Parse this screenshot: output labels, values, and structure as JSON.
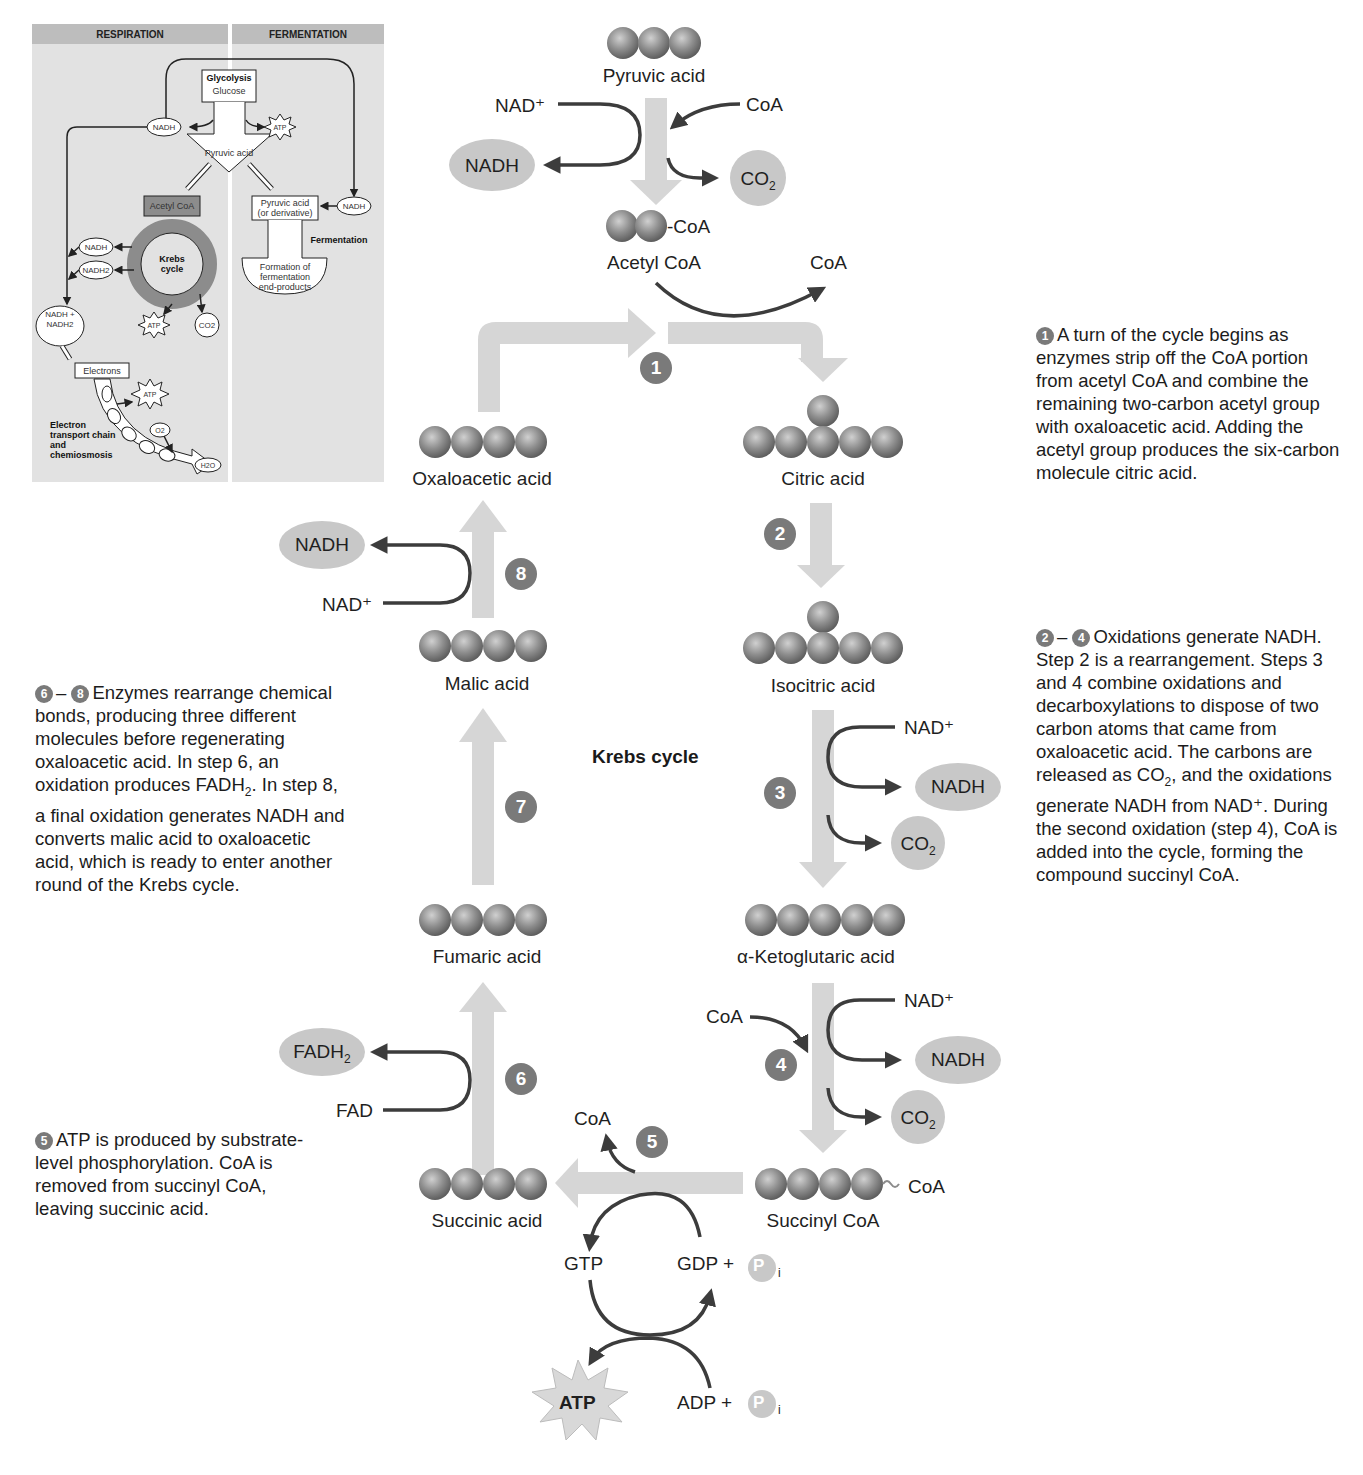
{
  "inset": {
    "header_left": "RESPIRATION",
    "header_right": "FERMENTATION",
    "glycolysis": "Glycolysis",
    "glucose": "Glucose",
    "pyruvic_acid": "Pyruvic acid",
    "nadh": "NADH",
    "atp": "ATP",
    "acetyl_coa": "Acetyl CoA",
    "krebs_cycle_1": "Krebs",
    "krebs_cycle_2": "cycle",
    "nadh2": "NADH2",
    "nadh_nadh2": "NADH + NADH2",
    "co2": "CO2",
    "electrons": "Electrons",
    "etc_label": "Electron transport chain and chemiosmosis",
    "o2": "O2",
    "h2o": "H2O",
    "pyruvic_derivative_1": "Pyruvic acid",
    "pyruvic_derivative_2": "(or derivative)",
    "fermentation": "Fermentation",
    "formation_1": "Formation of",
    "formation_2": "fermentation",
    "formation_3": "end-products"
  },
  "diagram": {
    "title": "Krebs cycle",
    "molecules": {
      "pyruvic_acid": "Pyruvic acid",
      "acetyl_coa": "Acetyl CoA",
      "acetyl_coa_tag": "-CoA",
      "oxaloacetic_acid": "Oxaloacetic acid",
      "citric_acid": "Citric acid",
      "isocitric_acid": "Isocitric acid",
      "alpha_ketoglutaric_acid": "α-Ketoglutaric acid",
      "succinyl_coa": "Succinyl CoA",
      "succinyl_coa_tag": "CoA",
      "succinic_acid": "Succinic acid",
      "fumaric_acid": "Fumaric acid",
      "malic_acid": "Malic acid"
    },
    "cofactors": {
      "nad_plus": "NAD⁺",
      "nadh": "NADH",
      "coa": "CoA",
      "co2": "CO",
      "co2_sub": "2",
      "fad": "FAD",
      "fadh2": "FADH",
      "fadh2_sub": "2",
      "gtp": "GTP",
      "gdp_pi": "GDP +",
      "adp_pi": "ADP +",
      "p": "P",
      "p_sub": "i",
      "atp": "ATP"
    },
    "steps": [
      "1",
      "2",
      "3",
      "4",
      "5",
      "6",
      "7",
      "8"
    ]
  },
  "notes": {
    "step1": {
      "badge": "1",
      "text": "A turn of the cycle begins as enzymes strip off the CoA portion from acetyl CoA and combine the remaining two-carbon acetyl group with oxaloacetic acid. Adding the acetyl group produces the six-carbon molecule citric acid."
    },
    "step2_4": {
      "badge_a": "2",
      "dash": "–",
      "badge_b": "4",
      "text_1": "Oxidations generate NADH. Step 2 is a rearrangement. Steps 3 and 4 combine oxidations and decarboxylations to dispose of two carbon atoms that came from oxaloacetic acid. The carbons are released as CO",
      "sub": "2",
      "text_2": ", and the oxidations generate NADH from NAD⁺. During the second oxidation (step 4), CoA is added into the cycle, forming the compound succinyl CoA."
    },
    "step6_8": {
      "badge_a": "6",
      "dash": "–",
      "badge_b": "8",
      "text_1": "Enzymes rearrange chemical bonds, producing three different molecules before regenerating oxaloacetic acid. In step 6, an oxidation produces FADH",
      "sub": "2",
      "text_2": ". In step 8, a final oxidation generates NADH and converts malic acid to oxaloacetic acid, which is ready to enter another round of the Krebs cycle."
    },
    "step5": {
      "badge": "5",
      "text": "ATP is produced by substrate-level phosphorylation. CoA is removed from succinyl CoA, leaving succinic acid."
    }
  },
  "colors": {
    "flow_arrow": "#d6d6d6",
    "reaction_arrow": "#3c3c3c",
    "sphere": "#8c8c8c",
    "badge": "#7a7a7a",
    "oval": "#c8c8c8",
    "inset_bg": "#e2e2e2"
  }
}
